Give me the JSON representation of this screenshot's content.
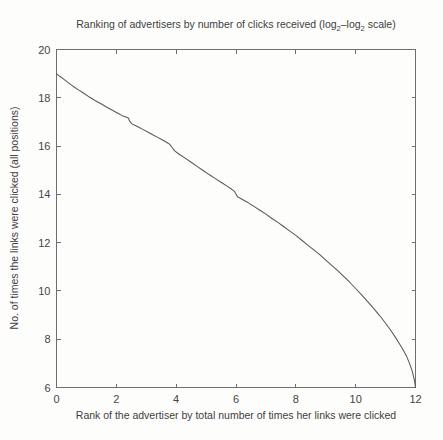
{
  "figure": {
    "background_color": "#fdfdfc",
    "axis_color": "#6f6f6f",
    "line_color": "#585858"
  },
  "chart_data": {
    "type": "line",
    "title": "Ranking of advertisers by number of clicks received (log",
    "title_sub1": "2",
    "title_mid": "–log",
    "title_sub2": "2",
    "title_end": " scale)",
    "title_full": "Ranking of advertisers by number of clicks received (log2–log2 scale)",
    "xlabel": "Rank of the advertiser by total number of times her links were clicked",
    "ylabel": "No. of times the links were clicked (all positions)",
    "xlim": [
      0,
      12
    ],
    "ylim": [
      6,
      20
    ],
    "xticks": [
      0,
      2,
      4,
      6,
      8,
      10,
      12
    ],
    "xtick_labels": [
      "0",
      "2",
      "4",
      "6",
      "8",
      "10",
      "12"
    ],
    "yticks": [
      6,
      8,
      10,
      12,
      14,
      16,
      18,
      20
    ],
    "ytick_labels": [
      "6",
      "8",
      "10",
      "12",
      "14",
      "16",
      "18",
      "20"
    ],
    "grid": false,
    "legend": null,
    "series": [
      {
        "name": "advertiser click distribution",
        "x": [
          0.0,
          0.12,
          0.25,
          0.4,
          0.55,
          0.72,
          0.9,
          1.1,
          1.3,
          1.5,
          1.7,
          1.9,
          2.05,
          2.2,
          2.32,
          2.4,
          2.45,
          2.52,
          2.62,
          2.75,
          2.9,
          3.05,
          3.2,
          3.35,
          3.5,
          3.62,
          3.7,
          3.78,
          3.85,
          3.95,
          4.1,
          4.3,
          4.5,
          4.7,
          4.9,
          5.1,
          5.3,
          5.5,
          5.7,
          5.85,
          5.95,
          6.05,
          6.2,
          6.4,
          6.6,
          6.8,
          7.0,
          7.2,
          7.4,
          7.6,
          7.8,
          8.0,
          8.2,
          8.4,
          8.6,
          8.8,
          9.0,
          9.2,
          9.4,
          9.6,
          9.8,
          10.0,
          10.2,
          10.4,
          10.6,
          10.8,
          11.0,
          11.2,
          11.4,
          11.55,
          11.7,
          11.8,
          11.9,
          11.96,
          12.0
        ],
        "y": [
          19.0,
          18.88,
          18.76,
          18.62,
          18.48,
          18.34,
          18.2,
          18.03,
          17.88,
          17.74,
          17.6,
          17.46,
          17.36,
          17.26,
          17.2,
          17.16,
          17.02,
          16.92,
          16.86,
          16.78,
          16.68,
          16.58,
          16.48,
          16.38,
          16.28,
          16.2,
          16.14,
          16.08,
          15.96,
          15.8,
          15.66,
          15.5,
          15.33,
          15.16,
          14.99,
          14.82,
          14.66,
          14.5,
          14.34,
          14.22,
          14.12,
          13.9,
          13.8,
          13.66,
          13.5,
          13.34,
          13.18,
          13.0,
          12.84,
          12.66,
          12.48,
          12.3,
          12.1,
          11.9,
          11.7,
          11.5,
          11.28,
          11.06,
          10.84,
          10.6,
          10.36,
          10.1,
          9.84,
          9.56,
          9.28,
          8.98,
          8.66,
          8.32,
          7.94,
          7.64,
          7.3,
          7.0,
          6.64,
          6.32,
          6.0
        ]
      }
    ]
  }
}
